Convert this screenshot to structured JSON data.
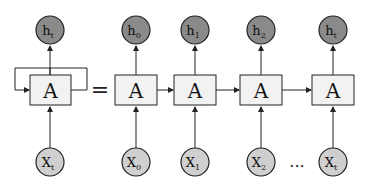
{
  "diagram": {
    "title_hint": "RNN unrolled",
    "colors": {
      "output_fill": "#8a8a8a",
      "input_fill": "#cfcfcf",
      "box_fill": "#f2f2f2",
      "stroke": "#222222"
    },
    "rolled": {
      "cell_label": "A",
      "output": {
        "base": "h",
        "sub": "t"
      },
      "input": {
        "base": "X",
        "sub": "t"
      }
    },
    "equals": "=",
    "unrolled": [
      {
        "cell_label": "A",
        "output": {
          "base": "h",
          "sub": "0"
        },
        "input": {
          "base": "X",
          "sub": "0"
        }
      },
      {
        "cell_label": "A",
        "output": {
          "base": "h",
          "sub": "1"
        },
        "input": {
          "base": "X",
          "sub": "1"
        }
      },
      {
        "cell_label": "A",
        "output": {
          "base": "h",
          "sub": "2"
        },
        "input": {
          "base": "X",
          "sub": "2"
        }
      },
      {
        "cell_label": "A",
        "output": {
          "base": "h",
          "sub": "t"
        },
        "input": {
          "base": "X",
          "sub": "t"
        }
      }
    ],
    "ellipsis": "..."
  }
}
